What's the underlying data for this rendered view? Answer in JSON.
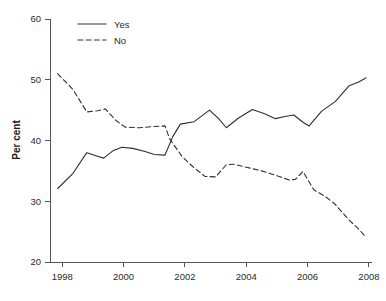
{
  "chart_data": {
    "type": "line",
    "title": "",
    "xlabel": "",
    "ylabel": "Per cent",
    "xlim": [
      1997.6,
      2008.1
    ],
    "ylim": [
      20,
      60
    ],
    "xticks": [
      1998,
      2000,
      2002,
      2004,
      2006,
      2008
    ],
    "yticks": [
      20,
      30,
      40,
      50,
      60
    ],
    "grid": false,
    "legend_position": "top-left",
    "series": [
      {
        "name": "Yes",
        "style": "solid",
        "color": "#2f2f2f",
        "points": [
          [
            1997.85,
            32.1
          ],
          [
            1998.35,
            34.6
          ],
          [
            1998.8,
            38.0
          ],
          [
            1999.1,
            37.5
          ],
          [
            1999.35,
            37.1
          ],
          [
            1999.65,
            38.3
          ],
          [
            1999.95,
            38.9
          ],
          [
            2000.3,
            38.7
          ],
          [
            2000.7,
            38.2
          ],
          [
            2001.0,
            37.7
          ],
          [
            2001.35,
            37.6
          ],
          [
            2001.6,
            40.6
          ],
          [
            2001.85,
            42.7
          ],
          [
            2002.3,
            43.1
          ],
          [
            2002.8,
            45.0
          ],
          [
            2003.1,
            43.6
          ],
          [
            2003.35,
            42.1
          ],
          [
            2003.75,
            43.7
          ],
          [
            2004.2,
            45.1
          ],
          [
            2004.6,
            44.4
          ],
          [
            2004.95,
            43.6
          ],
          [
            2005.3,
            44.0
          ],
          [
            2005.55,
            44.2
          ],
          [
            2005.85,
            43.0
          ],
          [
            2006.05,
            42.4
          ],
          [
            2006.45,
            44.8
          ],
          [
            2006.9,
            46.4
          ],
          [
            2007.35,
            49.0
          ],
          [
            2007.65,
            49.6
          ],
          [
            2007.9,
            50.3
          ]
        ]
      },
      {
        "name": "No",
        "style": "dashed",
        "color": "#2f2f2f",
        "points": [
          [
            1997.85,
            51.0
          ],
          [
            1998.35,
            48.4
          ],
          [
            1998.8,
            44.7
          ],
          [
            1999.15,
            44.9
          ],
          [
            1999.4,
            45.2
          ],
          [
            1999.75,
            43.3
          ],
          [
            2000.05,
            42.2
          ],
          [
            2000.5,
            42.1
          ],
          [
            2001.0,
            42.3
          ],
          [
            2001.35,
            42.4
          ],
          [
            2001.5,
            40.3
          ],
          [
            2001.9,
            37.4
          ],
          [
            2002.3,
            35.5
          ],
          [
            2002.65,
            34.1
          ],
          [
            2003.0,
            34.0
          ],
          [
            2003.35,
            36.0
          ],
          [
            2003.6,
            36.1
          ],
          [
            2004.0,
            35.6
          ],
          [
            2004.5,
            35.0
          ],
          [
            2004.95,
            34.3
          ],
          [
            2005.4,
            33.5
          ],
          [
            2005.6,
            33.6
          ],
          [
            2005.85,
            34.9
          ],
          [
            2006.2,
            31.9
          ],
          [
            2006.6,
            30.7
          ],
          [
            2006.9,
            29.5
          ],
          [
            2007.35,
            26.9
          ],
          [
            2007.65,
            25.5
          ],
          [
            2007.9,
            24.1
          ]
        ]
      }
    ],
    "legend": [
      {
        "label": "Yes",
        "style": "solid"
      },
      {
        "label": "No",
        "style": "dashed"
      }
    ]
  }
}
